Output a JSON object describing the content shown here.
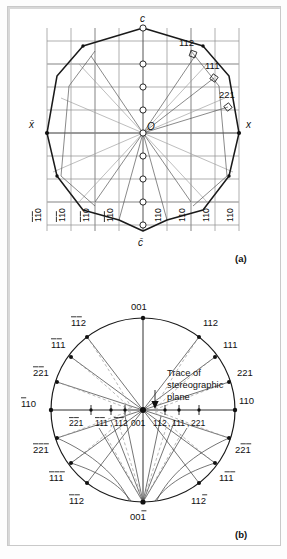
{
  "figure": {
    "panels": [
      {
        "tag": "(a)",
        "name": "crystal-projection"
      },
      {
        "tag": "(b)",
        "name": "stereographic-projection"
      }
    ]
  },
  "panel_a": {
    "tag": "(a)",
    "axis_labels": {
      "top": "c",
      "bottom": "c̄",
      "right": "x",
      "left": "x̄",
      "center": "O"
    },
    "face_labels": [
      {
        "text": "112",
        "bar": "none"
      },
      {
        "text": "111",
        "bar": "none"
      },
      {
        "text": "221",
        "bar": "none"
      }
    ],
    "bottom_labels": [
      {
        "digits": "110",
        "bars": [
          1,
          1,
          0
        ]
      },
      {
        "digits": "110",
        "bars": [
          1,
          1,
          0
        ]
      },
      {
        "digits": "110",
        "bars": [
          1,
          1,
          0
        ]
      },
      {
        "digits": "110",
        "bars": [
          1,
          1,
          0
        ]
      },
      {
        "digits": "110",
        "bars": [
          0,
          0,
          0
        ]
      },
      {
        "digits": "110",
        "bars": [
          0,
          0,
          0
        ]
      },
      {
        "digits": "110",
        "bars": [
          0,
          0,
          0
        ]
      },
      {
        "digits": "110",
        "bars": [
          0,
          0,
          0
        ]
      }
    ]
  },
  "panel_b": {
    "tag": "(b)",
    "annotation": {
      "line1": "Trace of",
      "line2": "stereographic",
      "line3": "plane"
    },
    "pole_labels": {
      "top": {
        "digits": "001",
        "bars": [
          0,
          0,
          0
        ]
      },
      "bottom": {
        "digits": "001",
        "bars": [
          0,
          0,
          1
        ]
      },
      "left": {
        "digits": "110",
        "bars": [
          1,
          0,
          0
        ]
      },
      "right": {
        "digits": "110",
        "bars": [
          0,
          0,
          0
        ]
      },
      "ul_112": {
        "digits": "112",
        "bars": [
          1,
          1,
          0
        ]
      },
      "ul_111": {
        "digits": "111",
        "bars": [
          1,
          1,
          0
        ]
      },
      "ul_221": {
        "digits": "221",
        "bars": [
          1,
          1,
          0
        ]
      },
      "ur_112": {
        "digits": "112",
        "bars": [
          0,
          0,
          0
        ]
      },
      "ur_111": {
        "digits": "111",
        "bars": [
          0,
          0,
          0
        ]
      },
      "ur_221": {
        "digits": "221",
        "bars": [
          0,
          0,
          0
        ]
      },
      "ll_221": {
        "digits": "221",
        "bars": [
          1,
          1,
          1
        ]
      },
      "ll_111": {
        "digits": "111",
        "bars": [
          1,
          1,
          1
        ]
      },
      "ll_112": {
        "digits": "112",
        "bars": [
          1,
          1,
          0
        ]
      },
      "lr_221": {
        "digits": "221",
        "bars": [
          0,
          1,
          1
        ]
      },
      "lr_111": {
        "digits": "111",
        "bars": [
          0,
          1,
          1
        ]
      },
      "lr_112": {
        "digits": "112",
        "bars": [
          0,
          0,
          1
        ]
      }
    },
    "equator_labels": {
      "left_221": {
        "digits": "221",
        "bars": [
          1,
          1,
          0
        ]
      },
      "left_111": {
        "digits": "111",
        "bars": [
          1,
          1,
          0
        ]
      },
      "left_112": {
        "digits": "112",
        "bars": [
          1,
          1,
          0
        ]
      },
      "center_001": {
        "digits": "001",
        "bars": [
          0,
          0,
          0
        ]
      },
      "right_112": {
        "digits": "112",
        "bars": [
          0,
          0,
          0
        ]
      },
      "right_111": {
        "digits": "111",
        "bars": [
          0,
          0,
          0
        ]
      },
      "right_221": {
        "digits": "221",
        "bars": [
          0,
          0,
          0
        ]
      },
      "comma": ","
    }
  },
  "colors": {
    "ink": "#111111",
    "grid": "#8d8d8d",
    "grid_bold": "#adadad",
    "ray_light": "#9a9a9a",
    "paper": "#ffffff",
    "frame": "#c9c9c9"
  }
}
